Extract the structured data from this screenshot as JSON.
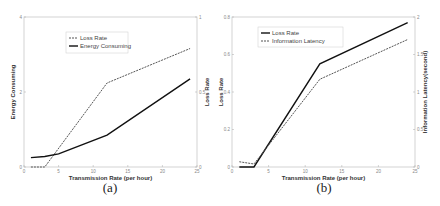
{
  "chart_data": [
    {
      "type": "line",
      "panel": "(a)",
      "xlabel": "Transmission Rate (per hour)",
      "ylabel": "Energy Consuming",
      "ylabel_right": "Loss Rate",
      "xlim": [
        0,
        25
      ],
      "ylim": [
        0,
        4
      ],
      "ylim_right": [
        0,
        1
      ],
      "xticks": [
        "0",
        "5",
        "10",
        "15",
        "20",
        "25"
      ],
      "yticks": [
        "0",
        "2",
        "4"
      ],
      "yticks_right": [
        "0",
        "0.5",
        "1"
      ],
      "grid": false,
      "legend_position": "upper left",
      "series": [
        {
          "name": "Loss Rate",
          "axis": "right",
          "style": "dashed",
          "x": [
            1,
            3,
            12,
            24
          ],
          "y": [
            0,
            0,
            0.56,
            0.79
          ]
        },
        {
          "name": "Energy Consuming",
          "axis": "left",
          "style": "solid",
          "x": [
            1,
            3,
            5,
            12,
            24
          ],
          "y": [
            0.25,
            0.28,
            0.35,
            0.85,
            2.35
          ]
        }
      ]
    },
    {
      "type": "line",
      "panel": "(b)",
      "xlabel": "Transmission Rate (per hour)",
      "ylabel": "Loss Rate",
      "ylabel_right": "Information Latency(second)",
      "xlim": [
        0,
        25
      ],
      "ylim": [
        0,
        0.8
      ],
      "ylim_right": [
        0,
        2
      ],
      "xticks": [
        "0",
        "5",
        "10",
        "15",
        "20",
        "25"
      ],
      "yticks": [
        "0",
        "0.2",
        "0.4",
        "0.6",
        "0.8"
      ],
      "yticks_right": [
        "0",
        "0.5",
        "1",
        "1.5",
        "2"
      ],
      "grid": false,
      "legend_position": "upper left",
      "series": [
        {
          "name": "Loss Rate",
          "axis": "left",
          "style": "solid",
          "x": [
            1,
            3,
            12,
            24
          ],
          "y": [
            0,
            0,
            0.55,
            0.77
          ]
        },
        {
          "name": "Information Latency",
          "axis": "right",
          "style": "dashed",
          "x": [
            1,
            3,
            12,
            24
          ],
          "y": [
            0.07,
            0.04,
            1.17,
            1.7
          ]
        }
      ]
    }
  ]
}
